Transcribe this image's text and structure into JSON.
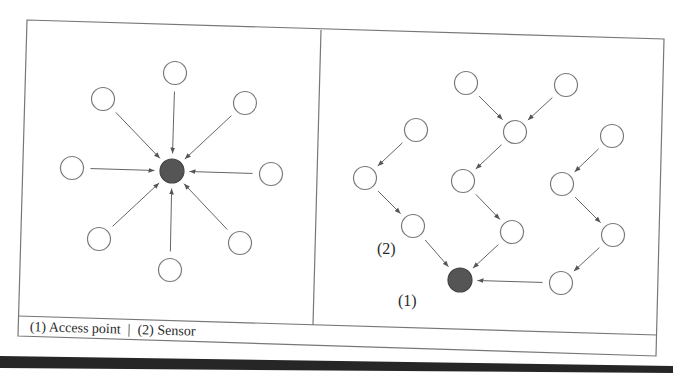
{
  "figure": {
    "caption": {
      "item1": "(1) Access point",
      "separator": "|",
      "item2": "(2) Sensor"
    },
    "labels": {
      "access_point": "(1)",
      "sensor": "(2)"
    },
    "colors": {
      "line": "#6a6a6a",
      "node_fill": "#ffffff",
      "node_stroke": "#7a7a7a",
      "access_point_fill": "#555555",
      "bottom_band": "#262626"
    },
    "left_panel": {
      "topology": "star",
      "access_point": {
        "x": 172,
        "y": 171
      },
      "sensors": [
        {
          "x": 175,
          "y": 73
        },
        {
          "x": 103,
          "y": 99
        },
        {
          "x": 245,
          "y": 103
        },
        {
          "x": 72,
          "y": 168
        },
        {
          "x": 271,
          "y": 174
        },
        {
          "x": 99,
          "y": 239
        },
        {
          "x": 240,
          "y": 243
        },
        {
          "x": 170,
          "y": 270
        }
      ]
    },
    "right_panel": {
      "topology": "multi-hop",
      "access_point": {
        "x": 460,
        "y": 280
      },
      "sensors": [
        {
          "id": "A",
          "x": 466,
          "y": 83
        },
        {
          "id": "B",
          "x": 566,
          "y": 85
        },
        {
          "id": "C",
          "x": 515,
          "y": 132
        },
        {
          "id": "D",
          "x": 416,
          "y": 130
        },
        {
          "id": "E",
          "x": 612,
          "y": 136
        },
        {
          "id": "F",
          "x": 365,
          "y": 178
        },
        {
          "id": "G",
          "x": 463,
          "y": 181
        },
        {
          "id": "H",
          "x": 562,
          "y": 184
        },
        {
          "id": "I",
          "x": 413,
          "y": 226
        },
        {
          "id": "J",
          "x": 512,
          "y": 232
        },
        {
          "id": "K",
          "x": 613,
          "y": 235
        },
        {
          "id": "L",
          "x": 561,
          "y": 283
        }
      ],
      "links": [
        [
          "A",
          "C"
        ],
        [
          "B",
          "C"
        ],
        [
          "C",
          "G"
        ],
        [
          "G",
          "J"
        ],
        [
          "J",
          "AP"
        ],
        [
          "D",
          "F"
        ],
        [
          "F",
          "I"
        ],
        [
          "I",
          "AP"
        ],
        [
          "E",
          "H"
        ],
        [
          "H",
          "K"
        ],
        [
          "K",
          "L"
        ],
        [
          "L",
          "AP"
        ]
      ]
    }
  }
}
